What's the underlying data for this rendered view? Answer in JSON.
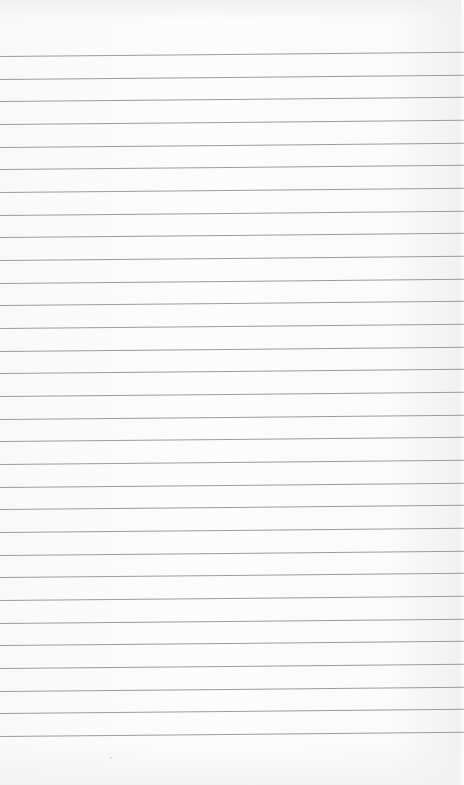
{
  "image": {
    "description": "Blank lined (ruled) sheet of paper, no writing",
    "background_color": "#fbfbfb",
    "line_color": "#9c9c9c",
    "line_count": 31,
    "first_line_y_left": 56,
    "line_spacing_px": 22.67,
    "slope_px_across_width": -4
  }
}
